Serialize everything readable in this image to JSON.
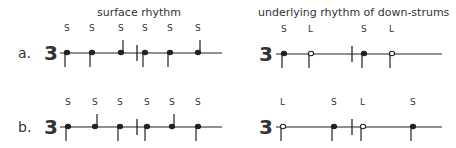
{
  "headings": {
    "left": "surface rhythm",
    "right": "underlying rhythm of down-strums"
  },
  "time_signature": "3",
  "rows": [
    {
      "label": "a.",
      "left": {
        "line_y": 53,
        "line_x": [
          60,
          222
        ],
        "barline_x": 137,
        "notes": [
          {
            "x": 67,
            "label": "S",
            "filled": true,
            "stem": "down"
          },
          {
            "x": 92,
            "label": "S",
            "filled": true,
            "stem": "down"
          },
          {
            "x": 121,
            "label": "S",
            "filled": true,
            "stem": "up"
          },
          {
            "x": 145,
            "label": "S",
            "filled": true,
            "stem": "down"
          },
          {
            "x": 170,
            "label": "S",
            "filled": true,
            "stem": "down"
          },
          {
            "x": 198,
            "label": "S",
            "filled": true,
            "stem": "up"
          }
        ]
      },
      "right": {
        "line_y": 54,
        "line_x": [
          276,
          442
        ],
        "barline_x": 352,
        "notes": [
          {
            "x": 284,
            "label": "S",
            "filled": true,
            "stem": "down"
          },
          {
            "x": 311,
            "label": "L",
            "filled": false,
            "stem": "down"
          },
          {
            "x": 364,
            "label": "S",
            "filled": true,
            "stem": "down"
          },
          {
            "x": 392,
            "label": "L",
            "filled": false,
            "stem": "down"
          }
        ]
      }
    },
    {
      "label": "b.",
      "left": {
        "line_y": 127,
        "line_x": [
          60,
          222
        ],
        "barline_x": 137,
        "notes": [
          {
            "x": 68,
            "label": "S",
            "filled": true,
            "stem": "down"
          },
          {
            "x": 95,
            "label": "S",
            "filled": true,
            "stem": "up"
          },
          {
            "x": 120,
            "label": "S",
            "filled": true,
            "stem": "down"
          },
          {
            "x": 147,
            "label": "S",
            "filled": true,
            "stem": "down"
          },
          {
            "x": 172,
            "label": "S",
            "filled": true,
            "stem": "up"
          },
          {
            "x": 198,
            "label": "S",
            "filled": true,
            "stem": "down"
          }
        ]
      },
      "right": {
        "line_y": 127,
        "line_x": [
          276,
          442
        ],
        "barline_x": 352,
        "notes": [
          {
            "x": 283,
            "label": "L",
            "filled": false,
            "stem": "down"
          },
          {
            "x": 334,
            "label": "S",
            "filled": true,
            "stem": "down"
          },
          {
            "x": 363,
            "label": "L",
            "filled": false,
            "stem": "down"
          },
          {
            "x": 413,
            "label": "S",
            "filled": true,
            "stem": "down"
          }
        ]
      }
    }
  ],
  "colors": {
    "ink": "#222222",
    "background": "#ffffff"
  }
}
